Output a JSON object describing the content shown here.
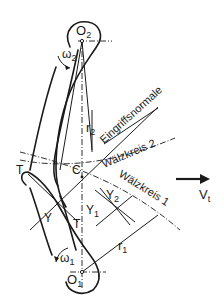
{
  "diagram": {
    "type": "gear-tooth-meshing",
    "labels": {
      "center_top": "O",
      "center_top_sub": "2",
      "center_bottom": "O",
      "center_bottom_sub": "1",
      "omega_top": "ω",
      "omega_top_sub": "2",
      "omega_bottom": "ω",
      "omega_bottom_sub": "1",
      "radius_top": "r",
      "radius_top_sub": "2",
      "radius_bottom": "r",
      "radius_bottom_sub": "1",
      "pitch_point": "C",
      "tangent_left": "T",
      "tangent_right": "T",
      "contact_point": "Y",
      "detail_y1": "Y",
      "detail_y1_sub": "1",
      "detail_y2": "Y",
      "detail_y2_sub": "2",
      "line_of_action": "Eingriffsnormale",
      "pitch_circle_2": "Wälzkreis 2",
      "pitch_circle_1": "Wälzkreis 1",
      "velocity": "V",
      "velocity_sub": "t"
    },
    "colors": {
      "stroke": "#1a1a1a",
      "background": "#ffffff"
    }
  }
}
